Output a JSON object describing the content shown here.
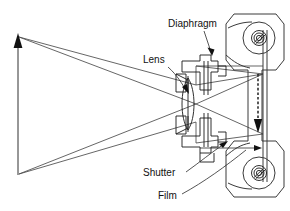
{
  "figure": {
    "background_color": "#ffffff",
    "line_color": "#1a1a1a",
    "width": 290,
    "height": 211
  },
  "labels": {
    "diaphragm": "Diaphragm",
    "lens": "Lens",
    "shutter": "Shutter",
    "film": "Film"
  },
  "parts": {
    "object_arrow_name": "object-arrow",
    "image_arrow_name": "image-arrow-inverted",
    "lens_element_name": "biconvex-lens",
    "film_plane_name": "film-plane",
    "top_spool_name": "film-spool-top",
    "bottom_spool_name": "film-spool-bottom"
  }
}
